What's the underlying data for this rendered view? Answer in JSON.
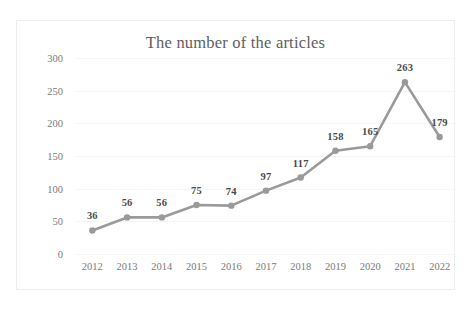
{
  "chart_data": {
    "type": "line",
    "title": "The number of the articles",
    "xlabel": "",
    "ylabel": "",
    "categories": [
      "2012",
      "2013",
      "2014",
      "2015",
      "2016",
      "2017",
      "2018",
      "2019",
      "2020",
      "2021",
      "2022"
    ],
    "values": [
      36,
      56,
      56,
      75,
      74,
      97,
      117,
      158,
      165,
      263,
      179
    ],
    "point_labels": [
      "36",
      "56",
      "56",
      "75",
      "74",
      "97",
      "117",
      "158",
      "165",
      "263",
      "179"
    ],
    "ylim": [
      0,
      300
    ],
    "y_ticks": [
      0,
      50,
      100,
      150,
      200,
      250,
      300
    ],
    "y_tick_labels": [
      "0",
      "50",
      "100",
      "150",
      "200",
      "250",
      "300"
    ],
    "grid": true,
    "legend": false,
    "series_color": "#9a9a9a",
    "marker_color": "#9a9a9a",
    "label_color": "#4a4a4a",
    "gridline_color": "#f4f5f7",
    "axis_text_color": "#7a7a7a",
    "title_color": "#5e5e5e",
    "border_color": "#eceef0",
    "background": "#ffffff"
  }
}
